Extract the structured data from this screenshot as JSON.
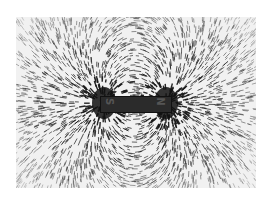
{
  "image": {
    "subject": "Iron filings showing magnetic field lines around a bar magnet",
    "magnet": {
      "left_pole_label": "S",
      "right_pole_label": "N"
    },
    "colors": {
      "background": "#ffffff",
      "paper": "#f1f1f1",
      "filings": "#1a1a1a",
      "magnet": "#2b2b2b"
    }
  }
}
